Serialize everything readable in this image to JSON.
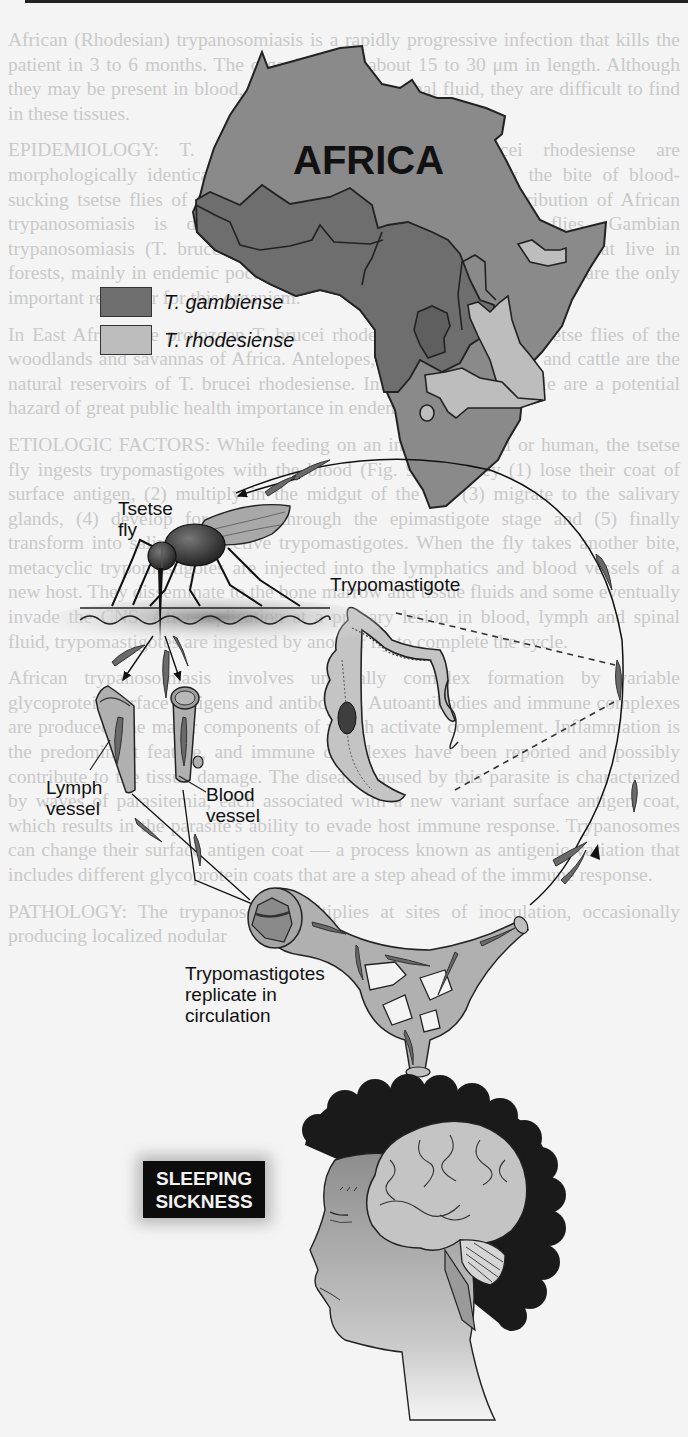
{
  "figure": {
    "map_title": "AFRICA",
    "legend": [
      {
        "label": "T. gambiense",
        "color": "#6e6e6e"
      },
      {
        "label": "T. rhodesiense",
        "color": "#bdbdbd"
      }
    ],
    "labels": {
      "tsetse_line1": "Tsetse",
      "tsetse_line2": "fly",
      "trypomastigote": "Trypomastigote",
      "lymph_line1": "Lymph",
      "lymph_line2": "vessel",
      "blood_line1": "Blood",
      "blood_line2": "vessel",
      "replicate_line1": "Trypomastigotes",
      "replicate_line2": "replicate in",
      "replicate_line3": "circulation"
    },
    "badge": {
      "line1": "SLEEPING",
      "line2": "SICKNESS"
    },
    "colors": {
      "map_base": "#8a8a8a",
      "gambiense": "#6e6e6e",
      "rhodesiense": "#bdbdbd",
      "vessel": "#b0b0b0",
      "parasite": "#6a6a6a",
      "brain": "#c4c4c4",
      "hair": "#1a1a1a",
      "background": "#f4f4f4"
    }
  },
  "background_text": {
    "paragraphs": [
      "African (Rhodesian) trypanosomiasis is a rapidly progressive infection that kills the patient in 3 to 6 months. The organisms are about 15 to 30 μm in length. Although they may be present in blood, lymph, or cerebrospinal fluid, they are difficult to find in these tissues.",
      "EPIDEMIOLOGY: T. brucei gambiense and T. brucei rhodesiense are morphologically identical protozoa transmitted to humans by the bite of blood-sucking tsetse flies of the genus Glossina. The geographic distribution of African trypanosomiasis is determined by the habitats of these flies. Gambian trypanosomiasis (T. brucei gambiense) is transmitted by tsetse flies that live in forests, mainly in endemic pockets in West and Central Africa. Humans are the only important reservoir for this organism.",
      "In East Africa, the protozoan T. brucei rhodesiense is spread by tsetse flies of the woodlands and savannas of Africa. Antelopes, other game animals and cattle are the natural reservoirs of T. brucei rhodesiense. Infected domestic cattle are a potential hazard of great public health importance in endemic areas.",
      "ETIOLOGIC FACTORS: While feeding on an infected animal or human, the tsetse fly ingests trypomastigotes with the blood (Fig. 9-77). They (1) lose their coat of surface antigen, (2) multiply in the midgut of the fly, (3) migrate to the salivary glands, (4) develop for weeks through the epimastigote stage and (5) finally transform into salivary, infective trypomastigotes. When the fly takes another bite, metacyclic trypomastigotes are injected into the lymphatics and blood vessels of a new host. They disseminate to the bone marrow and tissue fluids and some eventually invade the CNS. After replication at a primary lesion in blood, lymph and spinal fluid, trypomastigotes are ingested by another fly to complete the cycle.",
      "African trypanosomiasis involves unusually complex formation by variable glycoprotein surface antigens and antibodies. Autoantibodies and immune complexes are produced, the major components of which activate complement. Inflammation is the predominant feature, and immune complexes have been reported and possibly contribute to the tissue damage. The disease caused by this parasite is characterized by waves of parasitemia, each associated with a new variant surface antigen coat, which results in the parasite's ability to evade host immune response. Trypanosomes can change their surface antigen coat — a process known as antigenic variation that includes different glycoprotein coats that are a step ahead of the immune response.",
      "PATHOLOGY: The trypanosome multiplies at sites of inoculation, occasionally producing localized nodular"
    ],
    "headings": [
      "EPIDEMIOLOGY:",
      "ETIOLOGIC FACTORS:",
      "PATHOLOGY:"
    ]
  }
}
